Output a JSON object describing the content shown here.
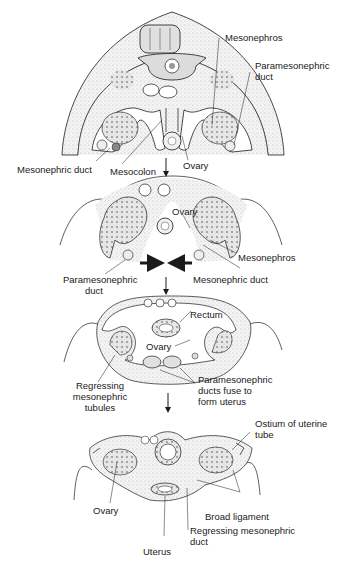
{
  "figure": {
    "stages": [
      {
        "id": "stage-1",
        "labels": {
          "mesonephros": "Mesonephros",
          "paramesonephric_duct_1": "Paramesonephric",
          "paramesonephric_duct_2": "duct",
          "mesonephric_duct": "Mesonephric duct",
          "mesocolon": "Mesocolon",
          "ovary": "Ovary"
        }
      },
      {
        "id": "stage-2",
        "labels": {
          "ovary": "Ovary",
          "mesonephros": "Mesonephros",
          "paramesonephric_duct_1": "Paramesonephric",
          "paramesonephric_duct_2": "duct",
          "mesonephric_duct": "Mesonephric duct"
        }
      },
      {
        "id": "stage-3",
        "labels": {
          "rectum": "Rectum",
          "ovary": "Ovary",
          "regressing_1": "Regressing",
          "regressing_2": "mesonephric",
          "regressing_3": "tubules",
          "fuse_1": "Paramesonephric",
          "fuse_2": "ducts fuse to",
          "fuse_3": "form uterus"
        }
      },
      {
        "id": "stage-4",
        "labels": {
          "ostium_1": "Ostium of uterine",
          "ostium_2": "tube",
          "ovary": "Ovary",
          "broad_ligament": "Broad ligament",
          "regressing_duct_1": "Regressing mesonephric",
          "regressing_duct_2": "duct",
          "uterus": "Uterus"
        }
      }
    ],
    "colors": {
      "line": "#1a1a1a",
      "stipple": "#d9d9d9",
      "tissue": "#eeeeee",
      "background": "#ffffff"
    }
  }
}
